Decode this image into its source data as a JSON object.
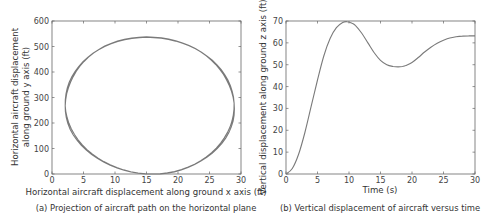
{
  "chart_data": [
    {
      "type": "line",
      "title": "",
      "caption": "(a) Projection of aircraft path on the horizontal plane",
      "xlabel": "Horizontal aircraft displacement along ground x axis (ft)",
      "ylabel_lines": [
        "Horizontal aircraft displacement",
        "along ground y axis (ft)"
      ],
      "xlim": [
        0,
        30
      ],
      "ylim": [
        0,
        600
      ],
      "xticks": [
        0,
        5,
        10,
        15,
        20,
        25,
        30
      ],
      "yticks": [
        0,
        100,
        200,
        300,
        400,
        500,
        600
      ],
      "grid": false,
      "series": [
        {
          "name": "path",
          "shape": "closed-ellipse",
          "center": [
            15.5,
            268
          ],
          "radius_x": 13.4,
          "radius_y": 268,
          "x": [
            2.1,
            2.6,
            4.0,
            6.2,
            9.0,
            12.0,
            15.5,
            19.0,
            22.2,
            25.2,
            27.4,
            28.7,
            28.9,
            28.2,
            26.5,
            24.0,
            21.0,
            18.0,
            15.5,
            12.5,
            9.5,
            6.5,
            4.2,
            2.7,
            2.1
          ],
          "y": [
            280,
            360,
            420,
            470,
            505,
            528,
            535,
            528,
            505,
            465,
            410,
            340,
            290,
            210,
            140,
            80,
            35,
            10,
            0,
            8,
            30,
            75,
            135,
            205,
            280
          ]
        }
      ],
      "line_color": "#7a7a7a"
    },
    {
      "type": "line",
      "title": "",
      "caption": "(b) Vertical displacement of aircraft versus time",
      "xlabel": "Time (s)",
      "ylabel_lines": [
        "Vertical displacement along ground z axis (ft)"
      ],
      "xlim": [
        0,
        30
      ],
      "ylim": [
        0,
        70
      ],
      "xticks": [
        0,
        5,
        10,
        15,
        20,
        25,
        30
      ],
      "yticks": [
        0,
        10,
        20,
        30,
        40,
        50,
        60,
        70
      ],
      "grid": false,
      "series": [
        {
          "name": "z displacement",
          "x": [
            0,
            1,
            2,
            3,
            4,
            5,
            6,
            7,
            8,
            9,
            9.7,
            10.5,
            11,
            12,
            13,
            14,
            15,
            16,
            17,
            17.8,
            18.5,
            19,
            20,
            21,
            22,
            23,
            24,
            25,
            26,
            27,
            28,
            29,
            30
          ],
          "y": [
            0,
            2.5,
            9,
            19,
            31,
            43,
            54,
            62,
            67,
            69.3,
            69.7,
            69,
            68,
            64.5,
            60,
            55.5,
            52,
            50,
            49.2,
            49,
            49.2,
            49.6,
            51,
            53.3,
            55.8,
            58,
            59.8,
            61.2,
            62.2,
            62.8,
            63.1,
            63.2,
            63.2
          ]
        }
      ],
      "line_color": "#7a7a7a"
    }
  ]
}
